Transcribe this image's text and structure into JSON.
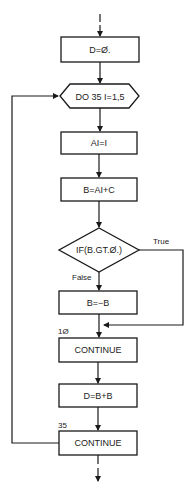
{
  "flowchart": {
    "nodes": {
      "init": {
        "text": "D=Ø.",
        "shape": "rectangle"
      },
      "loop_start": {
        "text": "DO 35 I=1,5",
        "shape": "hexagon"
      },
      "assign_ai": {
        "text": "AI=I",
        "shape": "rectangle"
      },
      "assign_b": {
        "text": "B=AI+C",
        "shape": "rectangle"
      },
      "decision": {
        "text": "IF(B.GT.Ø.)",
        "shape": "diamond"
      },
      "negate_b": {
        "text": "B=−B",
        "shape": "rectangle"
      },
      "continue_10": {
        "text": "CONTINUE",
        "label": "1Ø",
        "shape": "rectangle"
      },
      "assign_d": {
        "text": "D=B+B",
        "shape": "rectangle"
      },
      "continue_35": {
        "text": "CONTINUE",
        "label": "35",
        "shape": "rectangle"
      }
    },
    "edge_labels": {
      "true": "True",
      "false": "False"
    },
    "colors": {
      "stroke": "#1a1a1a",
      "background": "#ffffff",
      "text": "#222222"
    }
  }
}
